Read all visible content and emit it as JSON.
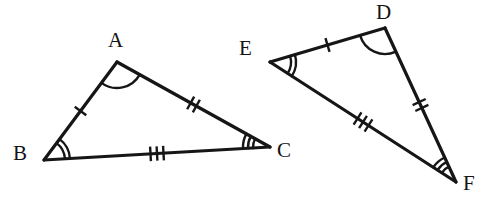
{
  "figure": {
    "stroke_color": "#161616",
    "label_color": "#131313",
    "background_color": "#ffffff",
    "stroke_width": 3.2,
    "mark_stroke_width": 2.4
  },
  "triangles": [
    {
      "id": "triangle-abc",
      "name": "Triangle ABC",
      "vertices": [
        {
          "label": "A",
          "x": 117,
          "y": 62,
          "label_x": 108,
          "label_y": 30,
          "arcs": 1
        },
        {
          "label": "B",
          "x": 44,
          "y": 160,
          "label_x": 13,
          "label_y": 143,
          "arcs": 2
        },
        {
          "label": "C",
          "x": 270,
          "y": 147,
          "label_x": 277,
          "label_y": 140,
          "arcs": 3
        }
      ],
      "sides": [
        {
          "from": "A",
          "to": "B",
          "ticks": 1
        },
        {
          "from": "A",
          "to": "C",
          "ticks": 2
        },
        {
          "from": "B",
          "to": "C",
          "ticks": 3
        }
      ]
    },
    {
      "id": "triangle-def",
      "name": "Triangle DEF",
      "vertices": [
        {
          "label": "D",
          "x": 385,
          "y": 28,
          "label_x": 376,
          "label_y": 2,
          "arcs": 1
        },
        {
          "label": "E",
          "x": 270,
          "y": 62,
          "label_x": 239,
          "label_y": 38,
          "arcs": 2
        },
        {
          "label": "F",
          "x": 456,
          "y": 182,
          "label_x": 463,
          "label_y": 173,
          "arcs": 3
        }
      ],
      "sides": [
        {
          "from": "E",
          "to": "D",
          "ticks": 1
        },
        {
          "from": "D",
          "to": "F",
          "ticks": 2
        },
        {
          "from": "E",
          "to": "F",
          "ticks": 3
        }
      ]
    }
  ],
  "labels": {
    "a": "A",
    "b": "B",
    "c": "C",
    "d": "D",
    "e": "E",
    "f": "F"
  }
}
